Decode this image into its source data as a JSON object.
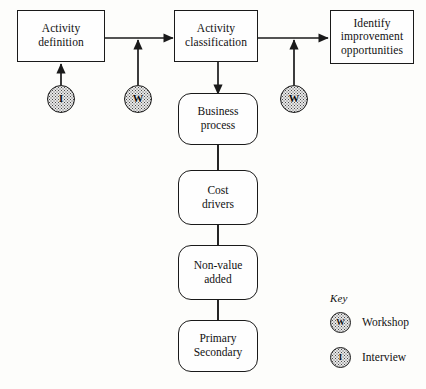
{
  "diagram": {
    "background_color": "#fdfdfb",
    "line_color": "#1a1a1a",
    "node_fill_color": "#e8e8e8",
    "top_boxes": [
      {
        "id": "activity-definition",
        "line1": "Activity",
        "line2": "definition",
        "line3": ""
      },
      {
        "id": "activity-classification",
        "line1": "Activity",
        "line2": "classification",
        "line3": ""
      },
      {
        "id": "identify-improvement-opportunities",
        "line1": "Identify",
        "line2": "improvement",
        "line3": "opportunities"
      }
    ],
    "column_boxes": [
      {
        "id": "business-process",
        "line1": "Business",
        "line2": "process"
      },
      {
        "id": "cost-drivers",
        "line1": "Cost",
        "line2": "drivers"
      },
      {
        "id": "non-value-added",
        "line1": "Non-value",
        "line2": "added"
      },
      {
        "id": "primary-secondary",
        "line1": "Primary",
        "line2": "Secondary"
      }
    ],
    "method_nodes": [
      {
        "id": "interview-node-1",
        "glyph": "I",
        "meaning": "Interview"
      },
      {
        "id": "workshop-node-1",
        "glyph": "W",
        "meaning": "Workshop"
      },
      {
        "id": "workshop-node-2",
        "glyph": "W",
        "meaning": "Workshop"
      }
    ],
    "key": {
      "title": "Key",
      "entries": [
        {
          "glyph": "W",
          "label": "Workshop"
        },
        {
          "glyph": "I",
          "label": "Interview"
        }
      ]
    }
  }
}
